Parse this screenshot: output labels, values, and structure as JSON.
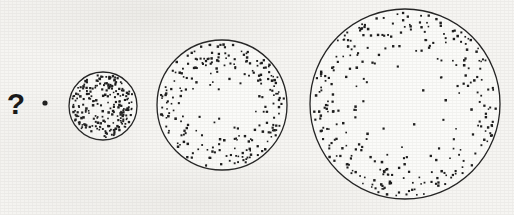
{
  "canvas": {
    "width": 514,
    "height": 215,
    "background_color": "#f6f5f2",
    "ink_color": "#1a1a1a",
    "circle_fill": "#ffffff"
  },
  "annotation": {
    "question_mark": {
      "label": "?",
      "x": 16,
      "y": 104,
      "font_size": 30
    },
    "single_dot": {
      "label": "single-dot",
      "x": 45,
      "y": 103,
      "radius": 2.6
    }
  },
  "chart_data": {
    "type": "scatter",
    "title": "",
    "subtitle": "",
    "xlabel": "",
    "ylabel": "",
    "grid": false,
    "legend": "none",
    "xlim": [
      0,
      514
    ],
    "ylim": [
      0,
      215
    ],
    "marker": {
      "shape": "square-dot",
      "size": 1.9,
      "color": "#1d1d1d"
    },
    "outline": {
      "color": "#242424",
      "width": 1.3
    },
    "series": [
      {
        "name": "point",
        "index": 0,
        "cx": 45,
        "cy": 103,
        "r": 2.6,
        "dot_count": 1,
        "outline": false,
        "rim_bias": 0,
        "relative_size": 0.03,
        "density_label": "single point"
      },
      {
        "name": "small-sphere",
        "index": 1,
        "cx": 103,
        "cy": 106,
        "r": 34,
        "dot_count": 225,
        "outline": true,
        "rim_bias": 0.35,
        "relative_size": 0.36,
        "density_label": "very dense"
      },
      {
        "name": "medium-sphere",
        "index": 2,
        "cx": 222,
        "cy": 105,
        "r": 65,
        "dot_count": 235,
        "outline": true,
        "rim_bias": 0.75,
        "relative_size": 0.68,
        "density_label": "medium"
      },
      {
        "name": "large-sphere",
        "index": 3,
        "cx": 405,
        "cy": 104,
        "r": 95,
        "dot_count": 300,
        "outline": true,
        "rim_bias": 1.15,
        "relative_size": 1.0,
        "density_label": "sparse centre, dense rim"
      }
    ]
  }
}
